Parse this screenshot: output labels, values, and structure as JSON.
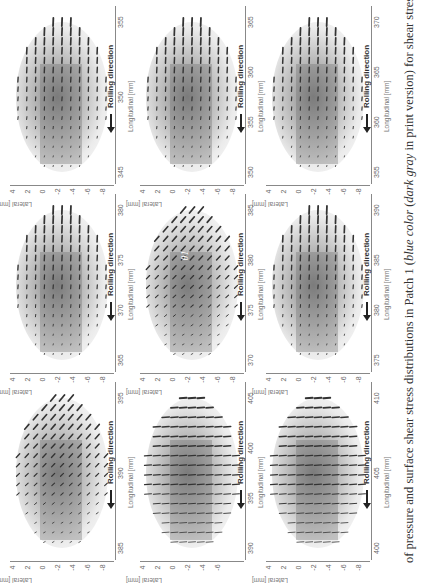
{
  "caption": {
    "part1": "of pressure and surface shear stress distributions in Patch 1 (",
    "italic1": "blue color",
    "part2": " (",
    "italic2": "dark gray",
    "part3": " in print version) for shear stress indicat"
  },
  "axes": {
    "lateral_label": "Lateral [mm]",
    "longitudinal_label": "Longitudinal [mm]",
    "rolling_label": "Rolling direction"
  },
  "annotation": {
    "theta": "θ1"
  },
  "panels": [
    {
      "row": 0,
      "col": 0,
      "long_ticks": [
        "355",
        "350",
        "345"
      ],
      "lat_ticks": [
        "4",
        "2",
        "0",
        "-2",
        "-4",
        "-6",
        "-8"
      ],
      "pattern": "vertical"
    },
    {
      "row": 0,
      "col": 1,
      "long_ticks": [
        "365",
        "360",
        "355",
        "350"
      ],
      "lat_ticks": [
        "4",
        "2",
        "0",
        "-2",
        "-4",
        "-6",
        "-8"
      ],
      "pattern": "vertical"
    },
    {
      "row": 0,
      "col": 2,
      "long_ticks": [
        "370",
        "365",
        "360",
        "355"
      ],
      "lat_ticks": [
        "4",
        "2",
        "0",
        "-2",
        "-4",
        "-6",
        "-8"
      ],
      "pattern": "vertical"
    },
    {
      "row": 1,
      "col": 0,
      "long_ticks": [
        "380",
        "375",
        "370",
        "365"
      ],
      "lat_ticks": [
        "4",
        "2",
        "0",
        "-2",
        "-4",
        "-6",
        "-8"
      ],
      "pattern": "vertical"
    },
    {
      "row": 1,
      "col": 1,
      "long_ticks": [
        "385",
        "380",
        "375",
        "370"
      ],
      "lat_ticks": [
        "4",
        "2",
        "0",
        "-2",
        "-4",
        "-6",
        "-8"
      ],
      "pattern": "diagonal"
    },
    {
      "row": 1,
      "col": 2,
      "long_ticks": [
        "390",
        "385",
        "380",
        "375"
      ],
      "lat_ticks": [
        "4",
        "2",
        "0",
        "-2",
        "-4",
        "-6",
        "-8"
      ],
      "pattern": "vertical"
    },
    {
      "row": 2,
      "col": 0,
      "long_ticks": [
        "395",
        "390",
        "385"
      ],
      "lat_ticks": [
        "4",
        "2",
        "0",
        "-2",
        "-4",
        "-6",
        "-8"
      ],
      "pattern": "diagonal"
    },
    {
      "row": 2,
      "col": 1,
      "long_ticks": [
        "405",
        "400",
        "395",
        "390"
      ],
      "lat_ticks": [
        "4",
        "2",
        "0",
        "-2",
        "-4",
        "-6"
      ],
      "pattern": "horizontal"
    },
    {
      "row": 2,
      "col": 2,
      "long_ticks": [
        "410",
        "405",
        "400"
      ],
      "lat_ticks": [
        "4",
        "2",
        "0",
        "-2",
        "-4",
        "-6",
        "-8"
      ],
      "pattern": "horizontal"
    }
  ]
}
